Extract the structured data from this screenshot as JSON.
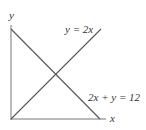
{
  "diagram": {
    "axes": {
      "x_label": "x",
      "y_label": "y"
    },
    "lines": [
      {
        "label": "y = 2x",
        "color": "#555555"
      },
      {
        "label": "2x + y = 12",
        "color": "#555555"
      }
    ]
  }
}
